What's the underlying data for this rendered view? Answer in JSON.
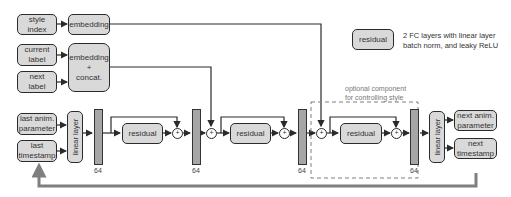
{
  "inputs": {
    "style_index": "style\nindex",
    "current_label": "current\nlabel",
    "next_label": "next\nlabel",
    "last_anim_parameter": "last anim.\nparameter",
    "last_timestamp": "last\ntimestamp"
  },
  "embedding": {
    "style": "embedding",
    "label_concat": "embedding\n+\nconcat."
  },
  "layers": {
    "linear_in": "linear layer",
    "linear_out": "linear layer",
    "residual_1": "residual",
    "residual_2": "residual",
    "residual_3": "residual",
    "plus": "+"
  },
  "dims": {
    "d1": "64",
    "d2": "64",
    "d3": "64",
    "d4": "64"
  },
  "outputs": {
    "next_anim_parameter": "next anim.\nparameter",
    "next_timestamp": "next\ntimestamp"
  },
  "optional": {
    "label": "optional component\nfor controlling style"
  },
  "legend": {
    "box_label": "residual",
    "description": "2 FC layers with linear layer\nbatch norm, and leaky ReLU"
  },
  "colors": {
    "box_fill": "#d9d9d9",
    "bar_fill": "#a6a6a6",
    "feedback_arrow": "#7f7f7f",
    "dashed_border": "#7f7f7f"
  }
}
